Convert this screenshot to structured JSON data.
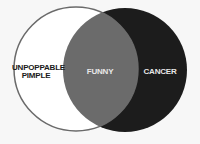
{
  "diagram": {
    "type": "venn",
    "sets": [
      {
        "label": "UNPOPPABLE\nPIMPLE",
        "label_line1": "UNPOPPABLE",
        "label_line2": "PIMPLE",
        "fill": "#ffffff",
        "stroke": "#6a6a6a"
      },
      {
        "label": "CANCER",
        "fill": "#1c1c1c"
      }
    ],
    "intersection": {
      "label": "FUNNY",
      "fill": "#6b6b6b"
    }
  },
  "colors": {
    "background": "#f7f7f7",
    "text_dark": "#1a1a1a",
    "text_light": "#e8e8e8"
  }
}
